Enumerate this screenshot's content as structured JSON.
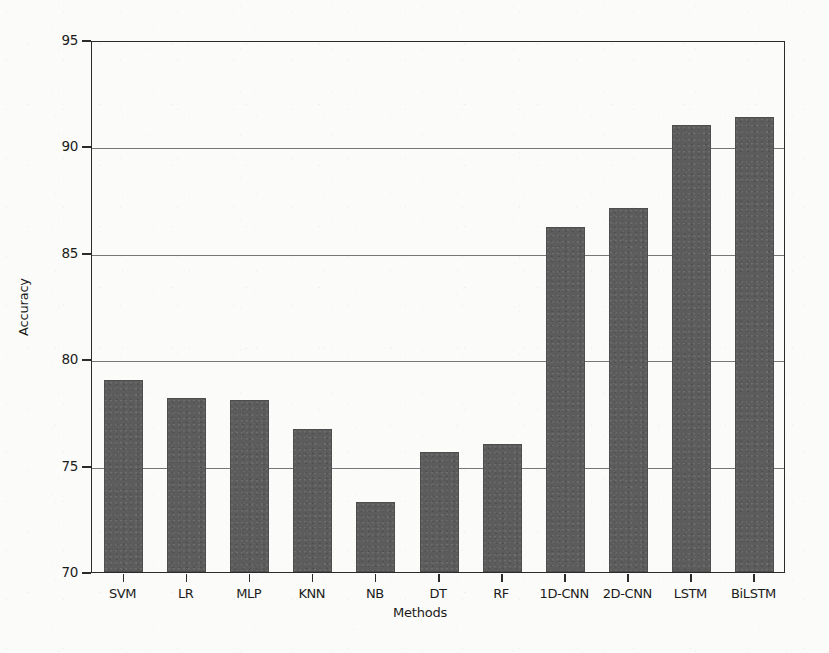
{
  "chart_data": {
    "type": "bar",
    "title": "",
    "xlabel": "Methods",
    "ylabel": "Accuracy",
    "categories": [
      "SVM",
      "LR",
      "MLP",
      "KNN",
      "NB",
      "DT",
      "RF",
      "1D-CNN",
      "2D-CNN",
      "LSTM",
      "BiLSTM"
    ],
    "values": [
      79.0,
      78.2,
      78.1,
      76.7,
      73.3,
      75.65,
      76.0,
      86.2,
      87.1,
      91.0,
      91.4
    ],
    "ylim": [
      70,
      95
    ],
    "yticks": [
      70,
      75,
      80,
      85,
      90,
      95
    ],
    "ytick_labels": [
      "70",
      "75",
      "80",
      "85",
      "90",
      "95"
    ],
    "grid": true,
    "grid_axis": "y",
    "legend": null,
    "bar_color": "#5c5c5c",
    "axis_color": "#2b2b2b",
    "grid_color": "#77777a",
    "background_color": "#fbfbf9"
  }
}
